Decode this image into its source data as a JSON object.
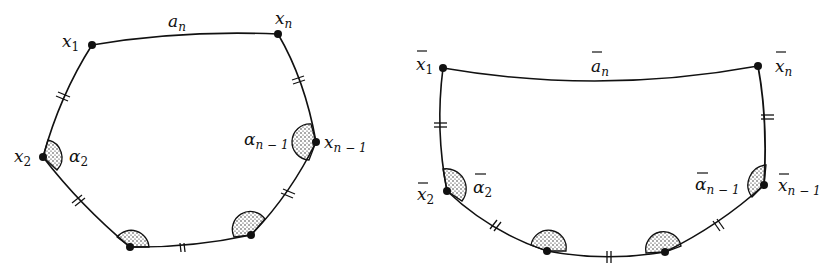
{
  "figure": {
    "left_polygon": {
      "vertices": [
        {
          "id": "x1",
          "label": "x",
          "sub": "1",
          "bar": false
        },
        {
          "id": "x2",
          "label": "x",
          "sub": "2",
          "bar": false
        },
        {
          "id": "xn_minus_1",
          "label": "x",
          "sub": "n − 1",
          "bar": false
        },
        {
          "id": "xn",
          "label": "x",
          "sub": "n",
          "bar": false
        }
      ],
      "edge_label": {
        "label": "a",
        "sub": "n",
        "bar": false
      },
      "angles": [
        {
          "id": "alpha2",
          "label": "α",
          "sub": "2",
          "bar": false
        },
        {
          "id": "alpha_n_minus_1",
          "label": "α",
          "sub": "n − 1",
          "bar": false
        }
      ]
    },
    "right_polygon": {
      "vertices": [
        {
          "id": "x1bar",
          "label": "x",
          "sub": "1",
          "bar": true
        },
        {
          "id": "x2bar",
          "label": "x",
          "sub": "2",
          "bar": true
        },
        {
          "id": "xn_minus_1bar",
          "label": "x",
          "sub": "n − 1",
          "bar": true
        },
        {
          "id": "xnbar",
          "label": "x",
          "sub": "n",
          "bar": true
        }
      ],
      "edge_label": {
        "label": "a",
        "sub": "n",
        "bar": true
      },
      "angles": [
        {
          "id": "alpha2bar",
          "label": "α",
          "sub": "2",
          "bar": true
        },
        {
          "id": "alpha_n_minus_1bar",
          "label": "α",
          "sub": "n − 1",
          "bar": true
        }
      ]
    }
  },
  "labels": {
    "L_x1": "x",
    "L_x1_sub": "1",
    "L_xn": "x",
    "L_xn_sub": "n",
    "L_an": "a",
    "L_an_sub": "n",
    "L_x2": "x",
    "L_x2_sub": "2",
    "L_a2": "α",
    "L_a2_sub": "2",
    "L_xnm1": "x",
    "L_xnm1_sub": "n − 1",
    "L_anm1": "α",
    "L_anm1_sub": "n − 1",
    "R_x1": "x",
    "R_x1_sub": "1",
    "R_xn": "x",
    "R_xn_sub": "n",
    "R_an": "a",
    "R_an_sub": "n",
    "R_x2": "x",
    "R_x2_sub": "2",
    "R_a2": "α",
    "R_a2_sub": "2",
    "R_xnm1": "x",
    "R_xnm1_sub": "n − 1",
    "R_anm1": "α",
    "R_anm1_sub": "n − 1"
  },
  "colors": {
    "ink": "#111111",
    "background": "#ffffff"
  }
}
